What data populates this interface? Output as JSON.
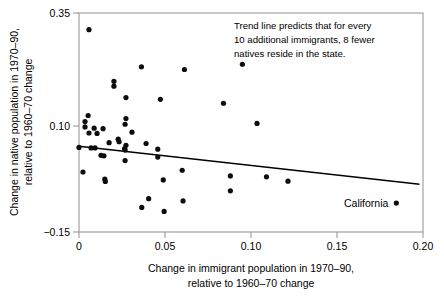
{
  "chart_data": {
    "type": "scatter",
    "title": "",
    "xlabel": "Change in immigrant population in 1970–90, relative to 1960–70 change",
    "xlabel_line1": "Change in immigrant population in 1970–90,",
    "xlabel_line2": "relative to 1960–70 change",
    "ylabel": "Change in native population in 1970–90, relative to 1960–70 change",
    "ylabel_line1": "Change in native population in 1970–90,",
    "ylabel_line2": "relative to 1960–70 change",
    "xlim": [
      0,
      0.2
    ],
    "ylim": [
      -0.15,
      0.35
    ],
    "xticks": [
      0,
      0.05,
      0.1,
      0.15,
      0.2
    ],
    "xtick_labels": [
      "0",
      "0.05",
      "0.10",
      "0.15",
      "0.20"
    ],
    "yticks": [
      0.35,
      0.1,
      -0.15
    ],
    "ytick_labels": [
      "0.35",
      "0.10",
      "−0.15"
    ],
    "grid": false,
    "legend": "none",
    "marker_color": "#0d0d0d",
    "trend_color": "#000000",
    "frame_color": "#9a9a9a",
    "points": [
      {
        "x": 0.0058,
        "y": 0.312
      },
      {
        "x": 0.095,
        "y": 0.233
      },
      {
        "x": 0.0363,
        "y": 0.227
      },
      {
        "x": 0.0613,
        "y": 0.221
      },
      {
        "x": 0.0203,
        "y": 0.194
      },
      {
        "x": 0.0203,
        "y": 0.183
      },
      {
        "x": 0.0273,
        "y": 0.157
      },
      {
        "x": 0.0473,
        "y": 0.153
      },
      {
        "x": 0.084,
        "y": 0.144
      },
      {
        "x": 0.0053,
        "y": 0.116
      },
      {
        "x": 0.0273,
        "y": 0.109
      },
      {
        "x": 0.0035,
        "y": 0.102
      },
      {
        "x": 0.1035,
        "y": 0.098
      },
      {
        "x": 0.0268,
        "y": 0.096
      },
      {
        "x": 0.0035,
        "y": 0.09
      },
      {
        "x": 0.0088,
        "y": 0.087
      },
      {
        "x": 0.014,
        "y": 0.086
      },
      {
        "x": 0.0308,
        "y": 0.078
      },
      {
        "x": 0.0058,
        "y": 0.076
      },
      {
        "x": 0.0105,
        "y": 0.075
      },
      {
        "x": 0.0228,
        "y": 0.062
      },
      {
        "x": 0.0233,
        "y": 0.056
      },
      {
        "x": 0.0175,
        "y": 0.054
      },
      {
        "x": 0.039,
        "y": 0.052
      },
      {
        "x": 0.0273,
        "y": 0.048
      },
      {
        "x": 0.0,
        "y": 0.043
      },
      {
        "x": 0.007,
        "y": 0.042
      },
      {
        "x": 0.0093,
        "y": 0.042
      },
      {
        "x": 0.0265,
        "y": 0.0405
      },
      {
        "x": 0.0458,
        "y": 0.039
      },
      {
        "x": 0.0268,
        "y": 0.037
      },
      {
        "x": 0.0128,
        "y": 0.025
      },
      {
        "x": 0.0145,
        "y": 0.024
      },
      {
        "x": 0.0458,
        "y": 0.021
      },
      {
        "x": 0.0268,
        "y": 0.013
      },
      {
        "x": 0.0023,
        "y": -0.013
      },
      {
        "x": 0.06,
        "y": -0.009
      },
      {
        "x": 0.088,
        "y": -0.022
      },
      {
        "x": 0.109,
        "y": -0.024
      },
      {
        "x": 0.015,
        "y": -0.029
      },
      {
        "x": 0.0153,
        "y": -0.0345
      },
      {
        "x": 0.049,
        "y": -0.031
      },
      {
        "x": 0.1215,
        "y": -0.034
      },
      {
        "x": 0.088,
        "y": -0.056
      },
      {
        "x": 0.0405,
        "y": -0.074
      },
      {
        "x": 0.0605,
        "y": -0.079
      },
      {
        "x": 0.0365,
        "y": -0.094
      },
      {
        "x": 0.0495,
        "y": -0.103
      },
      {
        "x": 0.1845,
        "y": -0.084,
        "label": "California"
      }
    ],
    "trend_line": {
      "x1": 0.0,
      "y1": 0.0455,
      "x2": 0.198,
      "y2": -0.041,
      "description": "Trend line predicts that for every 10 additional immigrants, 8 fewer natives reside in the state."
    },
    "annotation": {
      "line1": "Trend line predicts that for every",
      "line2": "10 additional immigrants, 8 fewer",
      "line3": "natives reside in the state."
    },
    "point_labels": [
      {
        "text": "California",
        "x": 0.1845,
        "y": -0.084
      }
    ]
  }
}
